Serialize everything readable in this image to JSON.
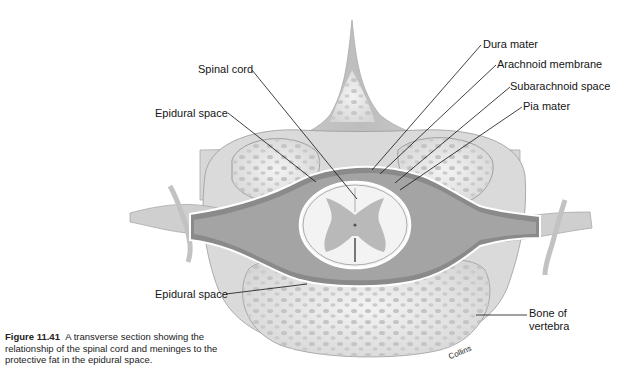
{
  "figure": {
    "number": "Figure 11.41",
    "caption": "A transverse section showing the relationship of the spinal cord and meninges to the protective fat in the epidural space.",
    "signature": "Collins"
  },
  "labels": {
    "spinal_cord": "Spinal cord",
    "epidural_space_upper": "Epidural space",
    "epidural_space_lower": "Epidural space",
    "dura_mater": "Dura mater",
    "arachnoid_membrane": "Arachnoid membrane",
    "subarachnoid_space": "Subarachnoid space",
    "pia_mater": "Pia mater",
    "bone_of_vertebra_line1": "Bone of",
    "bone_of_vertebra_line2": "vertebra"
  },
  "colors": {
    "bone": "#ececec",
    "bone_pore": "#c9c9c9",
    "ligament": "#cfcfcf",
    "dura": "#7d7d7d",
    "cord_white": "#f2f2f2",
    "cord_gray": "#b5b5b5",
    "leader_line": "#111111"
  }
}
